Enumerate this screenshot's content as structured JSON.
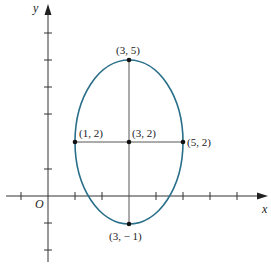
{
  "diagram": {
    "type": "ellipse-graph",
    "axes": {
      "x_label": "x",
      "y_label": "y",
      "origin_label": "O"
    },
    "ellipse": {
      "center": [
        3,
        2
      ],
      "semi_axis_x": 2,
      "semi_axis_y": 3,
      "stroke_color": "#2a6f8a"
    },
    "points": [
      {
        "name": "top",
        "label": "(3, 5)"
      },
      {
        "name": "center",
        "label": "(3, 2)"
      },
      {
        "name": "left",
        "label": "(1, 2)"
      },
      {
        "name": "right",
        "label": "(5, 2)"
      },
      {
        "name": "bottom",
        "label": "(3, − 1)"
      }
    ]
  }
}
